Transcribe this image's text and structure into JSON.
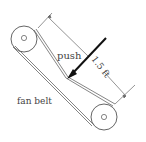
{
  "diagram": {
    "labels": {
      "push": "push",
      "dimension": "1.5 ft",
      "belt": "fan belt"
    },
    "colors": {
      "line": "#555555",
      "arrow": "#111111",
      "text": "#444444"
    }
  }
}
